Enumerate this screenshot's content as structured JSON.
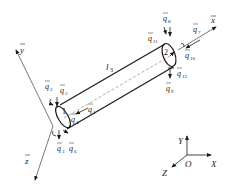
{
  "diagram": {
    "element_label": "l",
    "element_label_sub": "3",
    "node_labels": [
      "1",
      "2"
    ],
    "local_axes": [
      {
        "name": "y",
        "bar": true
      },
      {
        "name": "z",
        "bar": true
      },
      {
        "name": "x",
        "bar": true
      }
    ],
    "global_axes": {
      "origin": "O",
      "x": "X",
      "y": "Y",
      "z": "Z"
    },
    "dofs": [
      {
        "id": "q1",
        "base": "q",
        "sub": "1"
      },
      {
        "id": "q2",
        "base": "q",
        "sub": "2"
      },
      {
        "id": "q3",
        "base": "q",
        "sub": "3"
      },
      {
        "id": "q4",
        "base": "q",
        "sub": "4"
      },
      {
        "id": "q5",
        "base": "q",
        "sub": "5"
      },
      {
        "id": "q6",
        "base": "q",
        "sub": "6"
      },
      {
        "id": "q7",
        "base": "q",
        "sub": "7"
      },
      {
        "id": "q8",
        "base": "q",
        "sub": "8"
      },
      {
        "id": "q9",
        "base": "q",
        "sub": "9"
      },
      {
        "id": "q10",
        "base": "q",
        "sub": "10"
      },
      {
        "id": "q11",
        "base": "q",
        "sub": "11"
      },
      {
        "id": "q12",
        "base": "q",
        "sub": "12"
      }
    ],
    "colors": {
      "line": "#1a1a1a",
      "axis": "#555555",
      "background": "#ffffff"
    }
  }
}
